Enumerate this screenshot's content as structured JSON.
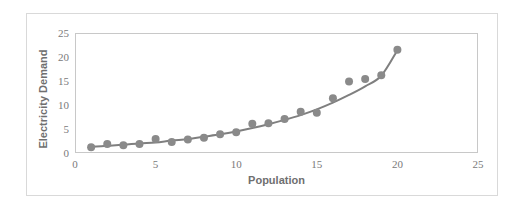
{
  "chart_data": {
    "type": "scatter",
    "title": "",
    "subtitle": "",
    "xlabel": "Population",
    "ylabel": "Electricity Demand",
    "xlim": [
      0,
      25
    ],
    "ylim": [
      0,
      25
    ],
    "xticks": [
      0,
      5,
      10,
      15,
      20,
      25
    ],
    "yticks": [
      0,
      5,
      10,
      15,
      20,
      25
    ],
    "xtick_labels": [
      "0",
      "5",
      "10",
      "15",
      "20",
      "25"
    ],
    "ytick_labels": [
      "0",
      "5",
      "10",
      "15",
      "20",
      "25"
    ],
    "grid": false,
    "legend": false,
    "legend_position": "none",
    "marker_color": "#8a8a8a",
    "line_color": "#7f7f7f",
    "marker_size": 4,
    "line_width": 2,
    "series": [
      {
        "name": "Electricity Demand",
        "marker": "circle",
        "x": [
          1,
          2,
          3,
          4,
          5,
          6,
          7,
          8,
          9,
          10,
          11,
          12,
          13,
          14,
          15,
          16,
          17,
          18,
          19,
          20
        ],
        "values": [
          1.2,
          1.9,
          1.6,
          1.9,
          2.9,
          2.3,
          2.8,
          3.2,
          3.9,
          4.3,
          6.1,
          6.2,
          7.1,
          8.6,
          8.4,
          11.4,
          14.9,
          15.4,
          16.2,
          21.5
        ]
      }
    ],
    "trendline": {
      "name": "exponential-fit",
      "type": "exponential",
      "x": [
        1,
        2,
        3,
        4,
        5,
        6,
        7,
        8,
        9,
        10,
        11,
        12,
        13,
        14,
        15,
        16,
        17,
        18,
        19,
        20
      ],
      "values": [
        1.3,
        1.5,
        1.7,
        2.0,
        2.2,
        2.6,
        2.9,
        3.4,
        3.9,
        4.5,
        5.2,
        6.0,
        6.9,
        7.9,
        9.1,
        10.5,
        12.1,
        13.9,
        16.1,
        21.4
      ]
    }
  },
  "axes": {
    "x_title": "Population",
    "y_title": "Electricity Demand",
    "x_labels": [
      "0",
      "5",
      "10",
      "15",
      "20",
      "25"
    ],
    "y_labels": [
      "0",
      "5",
      "10",
      "15",
      "20",
      "25"
    ]
  },
  "style": {
    "frame_color": "#d9d9d9",
    "axis_color": "#c8c8c8",
    "tick_text_color": "#7a7a7a",
    "title_text_color": "#6f6f6f",
    "background": "#ffffff"
  }
}
